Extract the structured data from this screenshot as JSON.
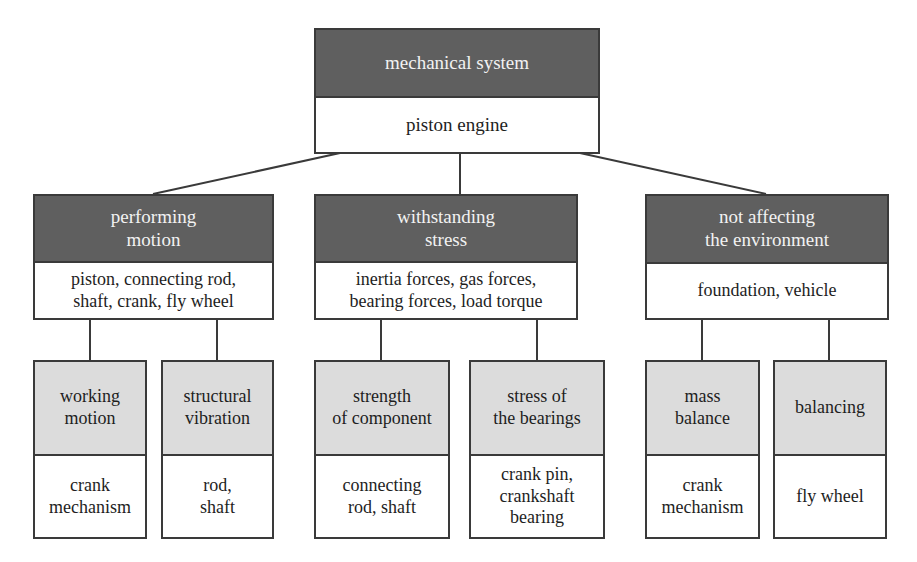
{
  "root": {
    "header": "mechanical system",
    "body": "piston engine"
  },
  "categories": [
    {
      "header": "performing\nmotion",
      "body": "piston, connecting rod,\nshaft, crank, fly wheel",
      "children": [
        {
          "header": "working\nmotion",
          "body": "crank\nmechanism"
        },
        {
          "header": "structural\nvibration",
          "body": "rod,\nshaft"
        }
      ]
    },
    {
      "header": "withstanding\nstress",
      "body": "inertia forces, gas forces,\nbearing forces, load torque",
      "children": [
        {
          "header": "strength\nof component",
          "body": "connecting\nrod, shaft"
        },
        {
          "header": "stress of\nthe bearings",
          "body": "crank pin,\ncrankshaft\nbearing"
        }
      ]
    },
    {
      "header": "not affecting\nthe environment",
      "body": "foundation, vehicle",
      "children": [
        {
          "header": "mass\nbalance",
          "body": "crank\nmechanism"
        },
        {
          "header": "balancing",
          "body": "fly wheel"
        }
      ]
    }
  ],
  "colors": {
    "dark_header": "#5f5f5f",
    "light_header": "#dcdcdc",
    "border": "#3a3a3a"
  }
}
